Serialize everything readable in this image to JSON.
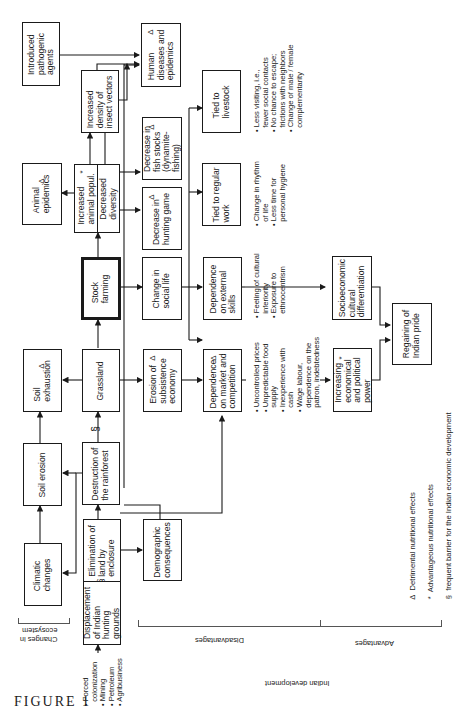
{
  "figure": {
    "label": "FIGURE 1",
    "orientation": "rotated 90 degrees counter-clockwise"
  },
  "nodes": {
    "introduced_pathogenic_agents": {
      "text": "Introduced\npathogenic\nagents",
      "mark": ""
    },
    "human_diseases": {
      "text": "Human\ndiseases and\nepidemics",
      "mark": "Δ"
    },
    "increased_density_insect_vectors": {
      "text": "Increased\ndensity of\ninsect vectors",
      "mark": ""
    },
    "animal_epidemics": {
      "text": "Animal\nepidemics",
      "mark": "Δ"
    },
    "increased_animal_popul": {
      "text": "Increased\nanimal popul.",
      "mark": "*"
    },
    "decreased_diversity": {
      "text": "Decreased\ndiversity",
      "mark": ""
    },
    "decrease_fish_stocks": {
      "text": "Decrease in\nfish stocks\n(dynamite-\nfishing)",
      "mark": "Δ"
    },
    "decrease_hunting_game": {
      "text": "Decrease in\nhunting game",
      "mark": "Δ"
    },
    "tied_to_livestock": {
      "text": "Tied to\nlivestock",
      "mark": ""
    },
    "tied_to_regular_work": {
      "text": "Tied to regular\nwork",
      "mark": ""
    },
    "soil_exhaustion": {
      "text": "Soil\nexhaustion",
      "mark": "Δ"
    },
    "grassland": {
      "text": "Grassland",
      "mark": ""
    },
    "stock_farming": {
      "text": "Stock\nfarming",
      "mark": ""
    },
    "change_social_life": {
      "text": "Change in\nsocial life",
      "mark": ""
    },
    "dependence_external_skills": {
      "text": "Dependence\non external\nskills",
      "mark": ""
    },
    "erosion_subsistence_economy": {
      "text": "Erosion of\nsubsistence\neconomy",
      "mark": "Δ"
    },
    "dependence_market": {
      "text": "Dependence\non market and\ncompetition",
      "mark": "Δ"
    },
    "socioeconomic_differentiation": {
      "text": "Socioeconomic\ncultural\ndifferentiation",
      "mark": ""
    },
    "increasing_power": {
      "text": "Increasing\neconomical\nand political\npower",
      "mark": "*"
    },
    "regaining_indian_pride": {
      "text": "Regaining of\nIndian pride",
      "mark": ""
    },
    "soil_erosion": {
      "text": "Soil erosion",
      "mark": ""
    },
    "destruction_rainforest": {
      "text": "Destruction of\nthe rainforest",
      "mark": ""
    },
    "climatic_changes": {
      "text": "Climatic\nchanges",
      "mark": ""
    },
    "elimination_land": {
      "text": "Elimination of\nland by\nenclosure",
      "mark": ""
    },
    "displacement_hunting_grounds": {
      "text": "Displacement\nof Indian\nhunting\ngrounds",
      "mark": ""
    },
    "demographic_consequences": {
      "text": "Demographic\nconsequences",
      "mark": ""
    }
  },
  "notes": {
    "livestock_effects": "• Less visiting, i.e.,\n  fewer social contacts\n• No chance to escape;\n  frictions with neighbors\n• Change of male / female\n  complementarity",
    "regular_work_effects": "• Change in rhythm\n  of life\n• Less time for\n  personal hygiene",
    "external_skills_effects": "• Feeling of cultural\n  inferiority\n• Exposure to\n  ethnocentrism",
    "market_effects": "• Uncontrolled prices\n• Unpredictable food\n  supply\n• Inexperience with\n  cash\n• Wage labour,\n  dependence on the\n  patron, indebtedness",
    "causes": "• Forced\n  colonization\n• Mining\n• Petroleum\n• Agribusiness"
  },
  "barrier_symbol": "§",
  "sections": {
    "changes_in_ecosystem": "Changes in\necosystem",
    "disadvantages": "Disadvantages",
    "advantages": "Advantages",
    "indian_development": "Indian development"
  },
  "legend": [
    {
      "symbol": "Δ",
      "label": "Detrimental nutritional effects"
    },
    {
      "symbol": "*",
      "label": "Advantageous nutritional effects"
    },
    {
      "symbol": "§",
      "label": "frequent barrier for the Indian economic development"
    }
  ]
}
